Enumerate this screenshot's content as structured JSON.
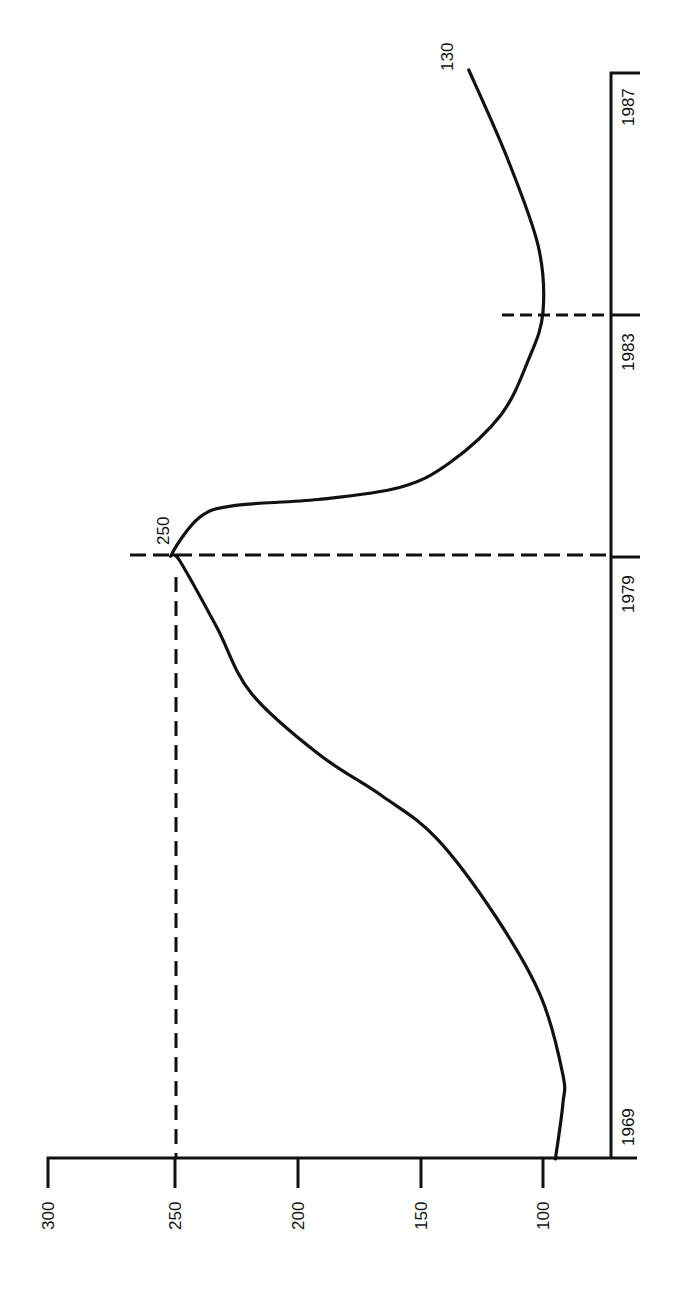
{
  "chart_data": {
    "type": "line",
    "title": "",
    "orientation": "rotated 90 degrees counter-clockwise",
    "xlabel": "",
    "ylabel": "",
    "x_ticks": [
      "1969",
      "1979",
      "1983",
      "1987"
    ],
    "y_ticks": [
      "100",
      "150",
      "200",
      "250",
      "300"
    ],
    "xlim": [
      1969,
      1987
    ],
    "ylim": [
      75,
      300
    ],
    "grid": false,
    "legend": null,
    "series": [
      {
        "name": "curve",
        "x": [
          1969.0,
          1969.9,
          1970.4,
          1971.7,
          1973.0,
          1974.3,
          1975.0,
          1975.7,
          1976.7,
          1977.8,
          1978.9,
          1979.0,
          1979.6,
          1979.8,
          1979.9,
          1980.1,
          1980.5,
          1981.3,
          1982.2,
          1983.0,
          1984.1,
          1985.6,
          1987.0
        ],
        "values": [
          95,
          92,
          92,
          101,
          119,
          143,
          165,
          191,
          218,
          232,
          247,
          250,
          239,
          225,
          191,
          158,
          138,
          117,
          106,
          100,
          102,
          115,
          130
        ]
      }
    ],
    "annotations": [
      {
        "text": "250",
        "x": 1979,
        "y": 250,
        "note": "peak value, dashed reference lines to both axes"
      },
      {
        "text": "130",
        "x": 1987,
        "y": 130,
        "note": "end value"
      },
      {
        "text": "",
        "x": 1983,
        "y": 100,
        "note": "dashed reference line at 1983 minimum"
      }
    ]
  },
  "labels": {
    "y_ticks": [
      "300",
      "250",
      "200",
      "150",
      "100"
    ],
    "x_ticks": [
      "1969",
      "1979",
      "1983",
      "1987"
    ],
    "peak": "250",
    "end": "130"
  }
}
